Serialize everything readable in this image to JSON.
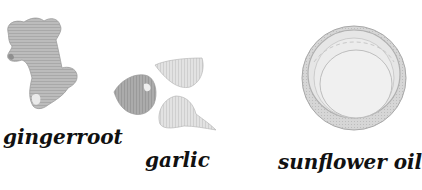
{
  "items": [
    {
      "name": "gingerroot",
      "label": "gingerroot"
    },
    {
      "name": "garlic",
      "label": "garlic"
    },
    {
      "name": "sunflower-oil",
      "label": "sunflower oil"
    }
  ],
  "colors": {
    "background": "#ffffff",
    "ginger_fill": "#b9b9b9",
    "garlic_dark": "#a8a8a8",
    "garlic_light": "#dcdcdc",
    "cap_rim": "#bdbdbd",
    "text": "#111111"
  }
}
